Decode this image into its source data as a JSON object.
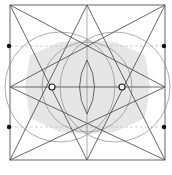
{
  "diagram": {
    "title": "",
    "colors": {
      "line": "#555555",
      "thin_line": "#8a8a8a",
      "dashed": "#bdbdbd",
      "shade": "#e6e6e6",
      "dot": "#111111"
    },
    "square": {
      "x1": 10,
      "y1": 5,
      "x2": 165,
      "y2": 160
    },
    "dots": [
      {
        "name": "left-upper-dot",
        "x": 9,
        "y": 46
      },
      {
        "name": "left-lower-dot",
        "x": 9,
        "y": 127
      },
      {
        "name": "right-upper-dot",
        "x": 164,
        "y": 46
      },
      {
        "name": "right-lower-dot",
        "x": 164,
        "y": 127
      }
    ],
    "open_points": [
      {
        "name": "left-open-point",
        "x": 52,
        "y": 87
      },
      {
        "name": "right-open-point",
        "x": 122,
        "y": 87
      }
    ]
  }
}
